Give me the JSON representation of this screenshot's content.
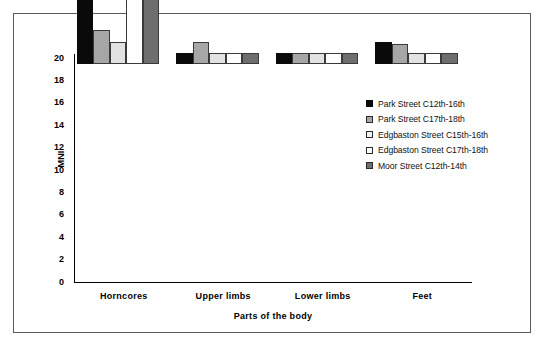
{
  "chart_data": {
    "type": "bar",
    "title": "",
    "xlabel": "Parts of the body",
    "ylabel": "MNI",
    "ylim": [
      0,
      20
    ],
    "ytick_step": 2,
    "yticks": [
      20,
      18,
      16,
      14,
      12,
      10,
      8,
      6,
      4,
      2,
      0
    ],
    "grid": false,
    "legend_position": "right-upper",
    "categories": [
      "Horncores",
      "Upper limbs",
      "Lower limbs",
      "Feet"
    ],
    "series": [
      {
        "name": "Park Street C12th-16th",
        "color": "#0a0a0a",
        "swatch": "black",
        "values": [
          13,
          1,
          1,
          2
        ]
      },
      {
        "name": "Park Street C17th-18th",
        "color": "#a6a6a6",
        "swatch": "medium-gray",
        "values": [
          3,
          2,
          1,
          1.8
        ]
      },
      {
        "name": "Edgbaston Street C15th-16th",
        "color": "#e2e2e2",
        "swatch": "light-gray",
        "values": [
          2,
          1,
          1,
          1
        ]
      },
      {
        "name": "Edgbaston Street C17th-18th",
        "color": "#ffffff",
        "swatch": "white",
        "values": [
          18,
          1,
          1,
          1
        ]
      },
      {
        "name": "Moor Street C12th-14th",
        "color": "#6e6e6e",
        "swatch": "dark-gray",
        "values": [
          11,
          1,
          1,
          1
        ]
      }
    ]
  },
  "axes": {
    "y_title": "MNI",
    "x_title": "Parts of the body"
  },
  "colors": {
    "series_1": "#0a0a0a",
    "series_2": "#a6a6a6",
    "series_3": "#e2e2e2",
    "series_4": "#ffffff",
    "series_5": "#6e6e6e",
    "frame": "#5a5a5a",
    "axis": "#000000",
    "background": "#ffffff"
  }
}
